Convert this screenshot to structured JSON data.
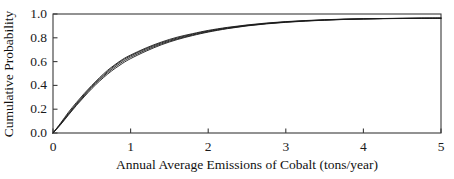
{
  "chart_data": {
    "type": "line",
    "title": "",
    "subtitle": "",
    "xlabel": "Annual Average Emissions of Cobalt (tons/year)",
    "ylabel": "Cumulative Probability",
    "xlim": [
      0,
      5
    ],
    "ylim": [
      0,
      1.0
    ],
    "xticks": [
      "0",
      "1",
      "2",
      "3",
      "4",
      "5"
    ],
    "xtick_values": [
      0,
      1,
      2,
      3,
      4,
      5
    ],
    "yticks": [
      "0.0",
      "0.2",
      "0.4",
      "0.6",
      "0.8",
      "1.0"
    ],
    "ytick_values": [
      0.0,
      0.2,
      0.4,
      0.6,
      0.8,
      1.0
    ],
    "grid": false,
    "legend": "none",
    "annotations": [],
    "line_color": "#1a1a1a",
    "frame_color": "#3a3a3a",
    "background_color": "#ffffff",
    "x": [
      0,
      0.1,
      0.2,
      0.3,
      0.4,
      0.5,
      0.6,
      0.7,
      0.8,
      0.9,
      1.0,
      1.2,
      1.4,
      1.6,
      1.8,
      2.0,
      2.25,
      2.5,
      2.75,
      3.0,
      3.25,
      3.5,
      3.75,
      4.0,
      4.25,
      4.5,
      4.75,
      5.0
    ],
    "series": [
      {
        "name": "curve-1",
        "values": [
          0.0,
          0.085,
          0.175,
          0.255,
          0.33,
          0.4,
          0.465,
          0.525,
          0.575,
          0.62,
          0.655,
          0.715,
          0.765,
          0.805,
          0.835,
          0.862,
          0.888,
          0.908,
          0.924,
          0.936,
          0.945,
          0.952,
          0.957,
          0.96,
          0.962,
          0.964,
          0.965,
          0.965
        ]
      },
      {
        "name": "curve-2",
        "values": [
          0.0,
          0.08,
          0.165,
          0.245,
          0.32,
          0.392,
          0.455,
          0.515,
          0.568,
          0.612,
          0.648,
          0.708,
          0.758,
          0.798,
          0.83,
          0.857,
          0.884,
          0.905,
          0.921,
          0.934,
          0.943,
          0.95,
          0.956,
          0.959,
          0.962,
          0.963,
          0.965,
          0.965
        ]
      },
      {
        "name": "curve-3",
        "values": [
          0.0,
          0.075,
          0.158,
          0.237,
          0.312,
          0.383,
          0.447,
          0.505,
          0.556,
          0.6,
          0.637,
          0.698,
          0.75,
          0.791,
          0.824,
          0.852,
          0.88,
          0.902,
          0.919,
          0.932,
          0.942,
          0.949,
          0.955,
          0.959,
          0.961,
          0.963,
          0.964,
          0.965
        ]
      },
      {
        "name": "curve-4",
        "values": [
          0.0,
          0.072,
          0.152,
          0.23,
          0.303,
          0.373,
          0.436,
          0.493,
          0.543,
          0.587,
          0.625,
          0.688,
          0.742,
          0.785,
          0.819,
          0.848,
          0.877,
          0.9,
          0.917,
          0.93,
          0.94,
          0.948,
          0.954,
          0.958,
          0.961,
          0.962,
          0.964,
          0.965
        ]
      }
    ]
  }
}
